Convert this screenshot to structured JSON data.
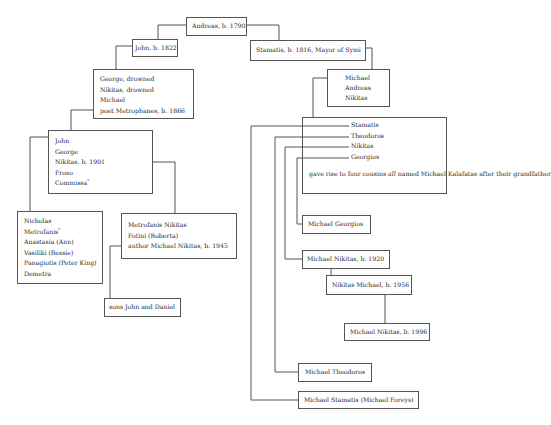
{
  "diagram": {
    "type": "family-tree",
    "root": {
      "label": "Andreas, b. 1790"
    },
    "left_branch": {
      "john": "John, b. 1822",
      "john_children": [
        "George, drowned",
        "Nikitas, drowned",
        "Michael",
        "poet Metrophanes, b. 1866"
      ],
      "metrophanes_children": [
        "John",
        "George",
        "Nikitas, b. 1901",
        "Froso",
        "Commissa"
      ],
      "metrophanes_children_marks": {
        "Commissa": "*"
      },
      "john_1901_children": [
        "Nicholas",
        "Metrofanis",
        "Anastasia (Ann)",
        "Vasiliki (Bessie)",
        "Panagiotis (Peter King)",
        "Demetra"
      ],
      "john_1901_children_marks": {
        "Metrofanis": "*"
      },
      "nikitas_1901_children": [
        "Metrofanis Nikitas",
        "Fotini (Roberta)",
        "author Michael Nikitas, b. 1945"
      ],
      "michael_1945_children": "sons John and Daniel"
    },
    "right_branch": {
      "stamatis": "Stamatis, b. 1816, Mayor of Symi",
      "stamatis_children": [
        "Michael",
        "Andreas",
        "Nikitas"
      ],
      "michael_children": [
        "Stamatis",
        "Theodoros",
        "Nikitas",
        "Georgios"
      ],
      "cousins_note": {
        "before": "gave rise to four cousins ",
        "emphasis": "all",
        "after": " named",
        "line2": "Michael Kalafatas after their grandfather"
      },
      "michael_georgios": "Michael Georgios",
      "michael_nikitas_1920": "Michael Nikitas, b. 1920",
      "nikitas_michael_1956": "Nikitas Michael, b. 1956",
      "michael_nikitas_1996": "Michael Nikitas, b. 1996",
      "michael_theodoros": "Michael Theodoros",
      "michael_stamatis": "Michael Stamatis (Michael Foreys)"
    },
    "style": {
      "line_color": "#555555",
      "text_color": "#2a2a2a",
      "background": "#ffffff"
    }
  }
}
